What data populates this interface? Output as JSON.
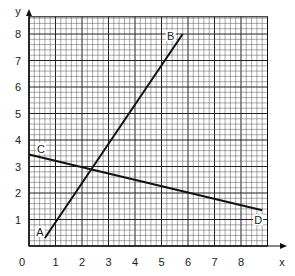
{
  "chart_data": {
    "type": "line",
    "title": "",
    "xlabel": "x",
    "ylabel": "y",
    "xlim": [
      0,
      9
    ],
    "ylim": [
      0,
      8.65
    ],
    "grid": true,
    "grid_minor_step": 0.2,
    "grid_major_step": 1,
    "origin_label": "0",
    "x_ticks": [
      "1",
      "2",
      "3",
      "4",
      "5",
      "6",
      "7",
      "8"
    ],
    "y_ticks": [
      "1",
      "2",
      "3",
      "4",
      "5",
      "6",
      "7",
      "8"
    ],
    "series": [
      {
        "name": "AB",
        "points": [
          {
            "label": "A",
            "x": 0.6,
            "y": 0.3
          },
          {
            "label": "B",
            "x": 5.8,
            "y": 8.0
          }
        ]
      },
      {
        "name": "CD",
        "points": [
          {
            "label": "C",
            "x": 0.0,
            "y": 3.45
          },
          {
            "label": "D",
            "x": 8.8,
            "y": 1.35
          }
        ]
      }
    ],
    "annotations": [
      "A",
      "B",
      "C",
      "D"
    ],
    "intersection_approx": {
      "x": 2.3,
      "y": 2.95
    }
  },
  "axes": {
    "x_label": "x",
    "y_label": "y",
    "origin": "0"
  },
  "colors": {
    "grid_minor": "#555555",
    "grid_major": "#222222",
    "line": "#111111",
    "background": "#ffffff"
  }
}
